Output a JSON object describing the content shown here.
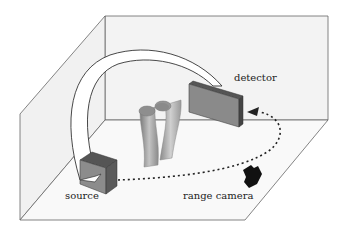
{
  "diagram": {
    "type": "3d-scene-schematic",
    "labels": {
      "detector": "detector",
      "source": "source",
      "range_camera": "range camera"
    },
    "components": [
      {
        "id": "room",
        "shape": "open box (back wall, left wall, floor)"
      },
      {
        "id": "source",
        "shape": "box",
        "color": "#8c8c8c"
      },
      {
        "id": "detector",
        "shape": "flat panel",
        "color": "#8a8a8a"
      },
      {
        "id": "gantry-arc",
        "shape": "curved band connecting source and detector",
        "color": "#ffffff"
      },
      {
        "id": "object",
        "shape": "two bent cylinders (legs)",
        "color": "#9a9a9a"
      },
      {
        "id": "range-camera",
        "shape": "small black camera",
        "color": "#111111"
      },
      {
        "id": "trajectory",
        "shape": "dotted arc with arrowhead from source to detector",
        "color": "#222222"
      }
    ],
    "colors": {
      "wall_fill": "#f4f4f4",
      "floor_fill": "#f8f8f8",
      "edge": "#555555"
    }
  }
}
